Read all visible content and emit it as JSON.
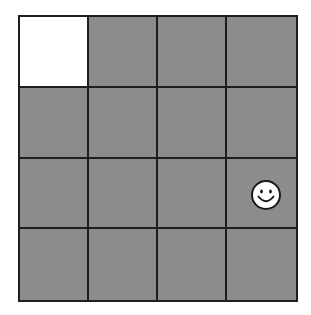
{
  "board": {
    "rows": 4,
    "cols": 4,
    "colors": {
      "hidden": "#8c8c8c",
      "revealed": "#ffffff",
      "gridline": "#1e1e1e"
    },
    "cells": [
      [
        {
          "state": "revealed",
          "content": ""
        },
        {
          "state": "hidden",
          "content": ""
        },
        {
          "state": "hidden",
          "content": ""
        },
        {
          "state": "hidden",
          "content": ""
        }
      ],
      [
        {
          "state": "hidden",
          "content": ""
        },
        {
          "state": "hidden",
          "content": ""
        },
        {
          "state": "hidden",
          "content": ""
        },
        {
          "state": "hidden",
          "content": ""
        }
      ],
      [
        {
          "state": "hidden",
          "content": ""
        },
        {
          "state": "hidden",
          "content": ""
        },
        {
          "state": "hidden",
          "content": ""
        },
        {
          "state": "hidden",
          "content": "smiley-face-icon"
        }
      ],
      [
        {
          "state": "hidden",
          "content": ""
        },
        {
          "state": "hidden",
          "content": ""
        },
        {
          "state": "hidden",
          "content": ""
        },
        {
          "state": "hidden",
          "content": ""
        }
      ]
    ],
    "player": {
      "icon": "smiley-face-icon",
      "row": 2,
      "col": 3
    }
  }
}
